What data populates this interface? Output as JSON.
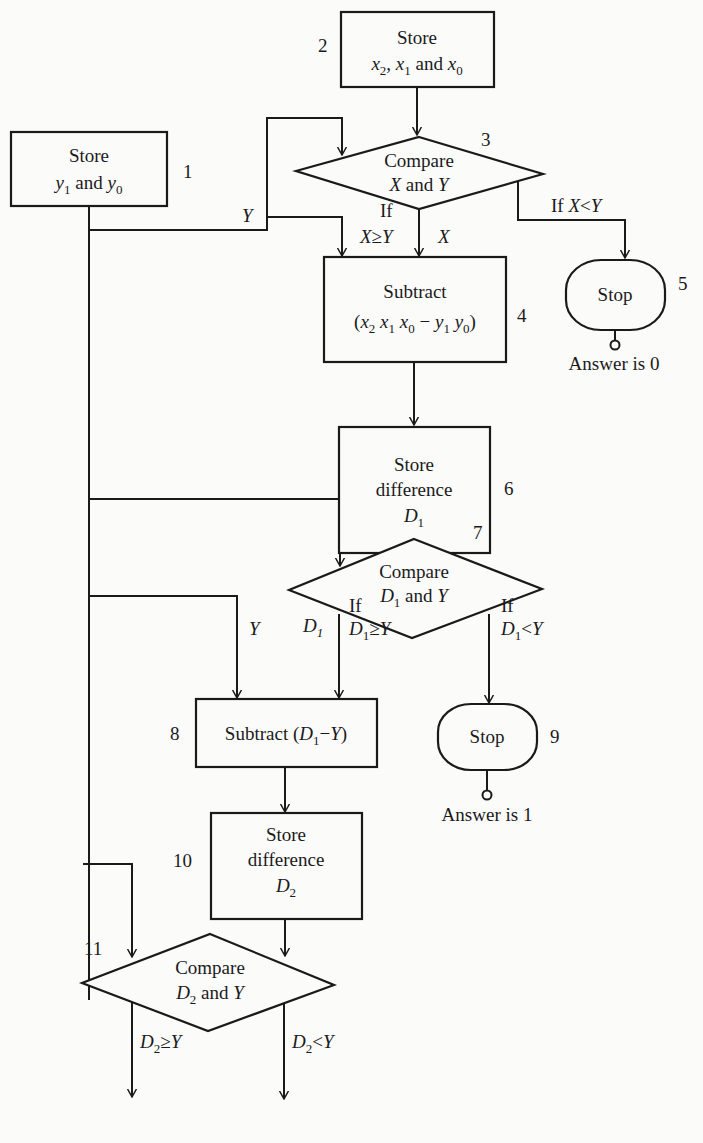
{
  "diagram": {
    "type": "flowchart",
    "colors": {
      "ink": "#1a1a1a",
      "paper": "#fbfbfa"
    },
    "nodes": [
      {
        "id": 1,
        "kind": "process",
        "lines": [
          "Store",
          "y1 and y0"
        ]
      },
      {
        "id": 2,
        "kind": "process",
        "lines": [
          "Store",
          "x2, x1 and x0"
        ]
      },
      {
        "id": 3,
        "kind": "decision",
        "lines": [
          "Compare",
          "X and Y"
        ]
      },
      {
        "id": 4,
        "kind": "process",
        "lines": [
          "Subtract",
          "(x2 x1 x0 − y1 y0)"
        ]
      },
      {
        "id": 5,
        "kind": "terminal",
        "lines": [
          "Stop"
        ],
        "note": "Answer is 0"
      },
      {
        "id": 6,
        "kind": "process",
        "lines": [
          "Store",
          "difference",
          "D1"
        ]
      },
      {
        "id": 7,
        "kind": "decision",
        "lines": [
          "Compare",
          "D1 and Y"
        ]
      },
      {
        "id": 8,
        "kind": "process",
        "lines": [
          "Subtract (D1 − Y)"
        ]
      },
      {
        "id": 9,
        "kind": "terminal",
        "lines": [
          "Stop"
        ],
        "note": "Answer is 1"
      },
      {
        "id": 10,
        "kind": "process",
        "lines": [
          "Store",
          "difference",
          "D2"
        ]
      },
      {
        "id": 11,
        "kind": "decision",
        "lines": [
          "Compare",
          "D2 and Y"
        ]
      },
      {
        "id": 12,
        "kind": "terminal",
        "lines": [
          "Stop"
        ],
        "note": "Answer is 2"
      }
    ],
    "labels": {
      "n1": "1",
      "n2": "2",
      "n3": "3",
      "n4": "4",
      "n5": "5",
      "n6": "6",
      "n7": "7",
      "n8": "8",
      "n9": "9",
      "n10": "10",
      "n11": "11",
      "store": "Store",
      "and": "and",
      "compare": "Compare",
      "subtract": "Subtract",
      "difference": "difference",
      "stop": "Stop",
      "if": "If",
      "continue": "Continue",
      "answer0": "Answer is 0",
      "answer1": "Answer is 1",
      "answer2": "Answer is 2",
      "Y": "Y",
      "X": "X",
      "D": "D",
      "x": "x",
      "y": "y",
      "s0": "0",
      "s1": "1",
      "s2": "2",
      "comma": ",",
      "ge": "≥",
      "lt": "<",
      "minus": "−",
      "lparen": "(",
      "rparen": ")"
    },
    "edges": [
      {
        "from": 2,
        "to": 3
      },
      {
        "from": 1,
        "to": 3,
        "label": "Y"
      },
      {
        "from": 1,
        "to": 4,
        "label": "Y"
      },
      {
        "from": 3,
        "to": 4,
        "label": "If X ≥ Y",
        "carry": "X"
      },
      {
        "from": 3,
        "to": 5,
        "label": "If X < Y"
      },
      {
        "from": 4,
        "to": 6
      },
      {
        "from": 6,
        "to": 7
      },
      {
        "from": 1,
        "to": 7
      },
      {
        "from": 1,
        "to": 8,
        "label": "Y"
      },
      {
        "from": 7,
        "to": 8,
        "label": "If D1 ≥ Y",
        "carry": "D1"
      },
      {
        "from": 7,
        "to": 9,
        "label": "If D1 < Y"
      },
      {
        "from": 8,
        "to": 10
      },
      {
        "from": 10,
        "to": 11
      },
      {
        "from": 1,
        "to": 11
      },
      {
        "from": 11,
        "to": "Continue",
        "label": "D2 ≥ Y"
      },
      {
        "from": 11,
        "to": 12,
        "label": "D2 < Y"
      }
    ]
  }
}
